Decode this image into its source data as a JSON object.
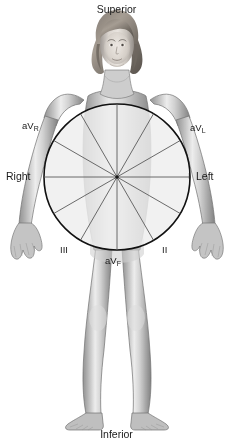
{
  "diagram": {
    "orientation_labels": {
      "superior": "Superior",
      "inferior": "Inferior",
      "right": "Right",
      "left": "Left"
    },
    "lead_labels": [
      {
        "id": "avr",
        "base": "aV",
        "subscript": "R",
        "angle_deg": -150
      },
      {
        "id": "avl",
        "base": "aV",
        "subscript": "L",
        "angle_deg": -30
      },
      {
        "id": "lead1",
        "base": "I",
        "subscript": "",
        "angle_deg": 0
      },
      {
        "id": "lead2",
        "base": "II",
        "subscript": "",
        "angle_deg": 60
      },
      {
        "id": "avf",
        "base": "aV",
        "subscript": "F",
        "angle_deg": 90
      },
      {
        "id": "lead3",
        "base": "III",
        "subscript": "",
        "angle_deg": 120
      }
    ],
    "wheel": {
      "center_x": 117,
      "center_y": 177,
      "radius": 73,
      "spoke_count": 12,
      "spoke_step_deg": 30,
      "fill_color": "#eeeeee",
      "stroke_color": "#111111",
      "spoke_color": "#5a5a5a"
    },
    "subject": {
      "description": "standing adult female, anterior view, grayscale",
      "skin_tone": "#b9b9b9",
      "hair_tone": "#6e6a66"
    }
  }
}
